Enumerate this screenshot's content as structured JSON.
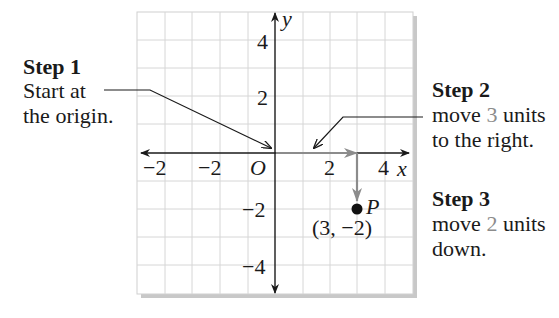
{
  "figure": {
    "type": "coordinate-plane-plotting-steps",
    "colors": {
      "grid_line": "#d6d6d6",
      "grid_border": "#cfcfcf",
      "shadow": "#c4c4c4",
      "axis": "#1a1a1a",
      "move_arrow": "#8c8c8c",
      "highlight_text": "#8c8c8c",
      "point": "#111111"
    },
    "grid": {
      "x_range": [
        -5,
        5
      ],
      "y_range": [
        -5,
        5
      ]
    },
    "axes": {
      "x_label": "x",
      "y_label": "y",
      "origin_label": "O",
      "x_tick_labels": [
        {
          "value": -4,
          "text": "−2"
        },
        {
          "value": -2,
          "text": "−2"
        },
        {
          "value": 2,
          "text": "2"
        },
        {
          "value": 4,
          "text": "4"
        }
      ],
      "y_tick_labels": [
        {
          "value": 4,
          "text": "4"
        },
        {
          "value": 2,
          "text": "2"
        },
        {
          "value": -2,
          "text": "−2"
        },
        {
          "value": -4,
          "text": "−4"
        }
      ]
    },
    "point": {
      "name": "P",
      "x": 3,
      "y": -2,
      "coord_open": "(3, ",
      "coord_neg": "−2",
      "coord_close": ")"
    }
  },
  "steps": [
    {
      "title": "Step 1",
      "lines": [
        "Start at",
        "the origin."
      ]
    },
    {
      "title": "Step 2",
      "line1_prefix": "move ",
      "line1_value": "3",
      "line1_suffix": " units",
      "line2": "to the right."
    },
    {
      "title": "Step 3",
      "line1_prefix": "move ",
      "line1_value": "2",
      "line1_suffix": " units",
      "line2": "down."
    }
  ]
}
